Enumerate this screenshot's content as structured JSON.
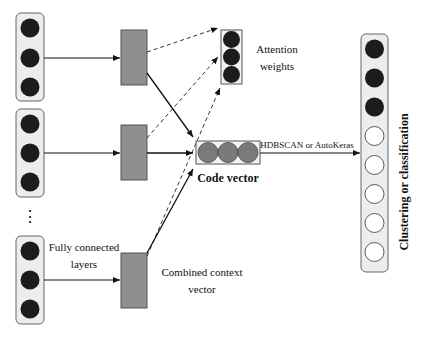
{
  "diagram": {
    "labels": {
      "fully_connected_line1": "Fully connected",
      "fully_connected_line2": "layers",
      "attention_line1": "Attention",
      "attention_line2": "weights",
      "code_vector": "Code vector",
      "combined_line1": "Combined context",
      "combined_line2": "vector",
      "hdbscan": "HDBSCAN or AutoKeras",
      "output": "Clustering or classification",
      "ellipsis": "⋮"
    },
    "colors": {
      "dark_node": "#1c1c1c",
      "gray_rect": "#8f8f8f",
      "code_node": "#7a7a7a",
      "container_fill": "#ededed",
      "stroke": "#555555",
      "arrow": "#111111"
    },
    "input_groups": [
      {
        "nodes": 3,
        "top": 13
      },
      {
        "nodes": 3,
        "top": 109
      },
      {
        "nodes": 3,
        "top": 236
      }
    ],
    "output_nodes": [
      "filled",
      "filled",
      "filled",
      "empty",
      "empty",
      "empty",
      "empty",
      "empty"
    ]
  }
}
